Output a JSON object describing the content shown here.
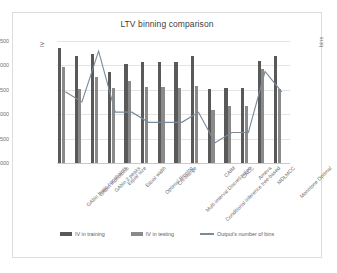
{
  "chart": {
    "title": "LTV binning comparison",
    "ylabel_left": "IV",
    "ylabel_right": "bins"
  },
  "axes": {
    "left_ticks": [
      "0.2500",
      "0.2000",
      "0.1500",
      "0.1000",
      "0.0500",
      "0.0000"
    ],
    "right_ticks": [
      "12",
      "10",
      "8",
      "6",
      "4",
      "2",
      "0"
    ]
  },
  "legend": {
    "items": [
      {
        "label": "IV in training",
        "color": "#595959"
      },
      {
        "label": "IV in testing",
        "color": "#8a8a8a"
      },
      {
        "label": "Output's number of bins",
        "color": "#7b8a99"
      }
    ]
  },
  "chart_data": {
    "type": "bar",
    "title": "LTV binning comparison",
    "xlabel": "",
    "ylabel": "IV",
    "y2label": "bins",
    "ylim": [
      0.0,
      0.25
    ],
    "y2lim": [
      0,
      12
    ],
    "grid": true,
    "legend_position": "bottom",
    "categories": [
      "GAbin basic constraints",
      "GAbin monotonic",
      "GAbin 3 peaks",
      "Equal size",
      "Equal width",
      "Optimal Binning",
      "Chi-Merge",
      "Multi-interval Discretization",
      "Conditional inference tree-based",
      "CAIM",
      "CACC",
      "Ameva",
      "MDLMCC",
      "Monotone Optimal"
    ],
    "series": [
      {
        "name": "IV in training",
        "type": "bar",
        "axis": "left",
        "values": [
          0.235,
          0.22,
          0.224,
          0.186,
          0.203,
          0.206,
          0.206,
          0.206,
          0.219,
          0.151,
          0.1535,
          0.1535,
          0.21,
          0.219
        ]
      },
      {
        "name": "IV in testing",
        "type": "bar",
        "axis": "left",
        "values": [
          0.196,
          0.152,
          0.177,
          0.153,
          0.168,
          0.156,
          0.156,
          0.154,
          0.157,
          0.108,
          0.1175,
          0.1175,
          0.192,
          0.151
        ]
      },
      {
        "name": "Output's number of bins",
        "type": "line",
        "axis": "right",
        "values": [
          7,
          6,
          11,
          5,
          5,
          4,
          4,
          4,
          5,
          2,
          3,
          3,
          9,
          7
        ]
      }
    ]
  }
}
